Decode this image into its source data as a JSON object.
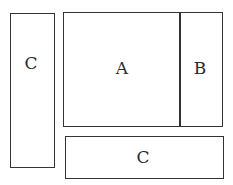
{
  "diagram": {
    "type": "region-layout",
    "regions": [
      {
        "id": "left-c",
        "label": "C",
        "x": 10,
        "y": 13,
        "w": 44,
        "h": 155
      },
      {
        "id": "a",
        "label": "A",
        "x": 64,
        "y": 12,
        "w": 115,
        "h": 114
      },
      {
        "id": "b",
        "label": "B",
        "x": 179,
        "y": 12,
        "w": 43,
        "h": 114
      },
      {
        "id": "bottom-c",
        "label": "C",
        "x": 65,
        "y": 136,
        "w": 158,
        "h": 43
      }
    ],
    "colors": {
      "stroke": "#333333",
      "text": "#2a2a2a",
      "background": "#ffffff"
    }
  }
}
